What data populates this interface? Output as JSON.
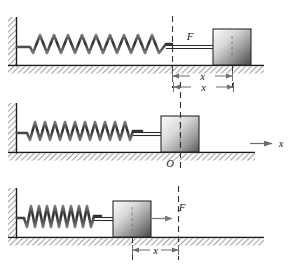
{
  "figure": {
    "colors": {
      "line": "#1a1a1a",
      "ground": "#2b2b2b",
      "hatch": "#555555",
      "spring": "#4a4a4a",
      "block_light": "#f2f2f2",
      "block_dark": "#4d4d4d",
      "dashed": "#333333",
      "dimension": "#6e6e6e"
    },
    "panels": [
      {
        "id": "panel-stretched",
        "state": "stretched",
        "spring_coils": 10,
        "labels": {
          "force": "F",
          "displacement": "x"
        },
        "has_force_label": true,
        "has_force_arrow": false,
        "has_dimension": true,
        "dimension_arrow_direction": "outward",
        "has_origin_label": false,
        "origin": "",
        "has_axis": false,
        "axis_label": ""
      },
      {
        "id": "panel-equilibrium",
        "state": "natural length",
        "spring_coils": 10,
        "labels": {
          "force": "",
          "displacement": "x"
        },
        "has_force_label": false,
        "has_force_arrow": false,
        "has_dimension": true,
        "dimension_arrow_direction": "outward",
        "has_origin_label": true,
        "origin": "O",
        "has_axis": true,
        "axis_label": "x"
      },
      {
        "id": "panel-compressed",
        "state": "compressed",
        "spring_coils": 9,
        "labels": {
          "force": "F",
          "displacement": "x"
        },
        "has_force_label": true,
        "has_force_arrow": true,
        "has_dimension": true,
        "dimension_arrow_direction": "inward",
        "has_origin_label": false,
        "origin": "",
        "has_axis": false,
        "axis_label": ""
      }
    ]
  }
}
